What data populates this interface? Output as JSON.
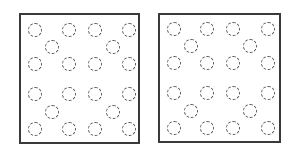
{
  "panels": [
    {
      "name": "left-panel",
      "box": {
        "left": 19,
        "top": 13,
        "width": 121,
        "height": 131
      },
      "circles": [
        [
          14,
          15
        ],
        [
          48,
          15
        ],
        [
          74,
          15
        ],
        [
          108,
          15
        ],
        [
          31,
          32
        ],
        [
          92,
          32
        ],
        [
          14,
          49
        ],
        [
          48,
          49
        ],
        [
          74,
          49
        ],
        [
          108,
          49
        ],
        [
          14,
          79
        ],
        [
          48,
          79
        ],
        [
          74,
          79
        ],
        [
          108,
          79
        ],
        [
          31,
          97
        ],
        [
          92,
          97
        ],
        [
          14,
          114
        ],
        [
          48,
          114
        ],
        [
          74,
          114
        ],
        [
          108,
          114
        ]
      ]
    },
    {
      "name": "right-panel",
      "box": {
        "left": 158,
        "top": 13,
        "width": 123,
        "height": 130
      },
      "circles": [
        [
          14,
          14
        ],
        [
          47,
          14
        ],
        [
          73,
          14
        ],
        [
          108,
          14
        ],
        [
          31,
          31
        ],
        [
          90,
          31
        ],
        [
          14,
          48
        ],
        [
          47,
          48
        ],
        [
          73,
          48
        ],
        [
          108,
          48
        ],
        [
          14,
          78
        ],
        [
          47,
          78
        ],
        [
          73,
          78
        ],
        [
          108,
          78
        ],
        [
          31,
          96
        ],
        [
          90,
          96
        ],
        [
          14,
          113
        ],
        [
          47,
          113
        ],
        [
          73,
          113
        ],
        [
          108,
          113
        ]
      ]
    }
  ],
  "style": {
    "border_color": "#3a3a3a",
    "circle_color": "#555555"
  }
}
